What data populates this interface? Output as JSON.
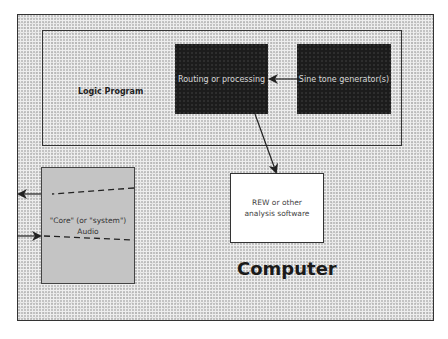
{
  "diagram": {
    "outer_box": {
      "label": "Computer"
    },
    "logic_program": {
      "label": "Logic Program"
    },
    "nodes": [
      {
        "id": "routing",
        "label": "Routing or processing"
      },
      {
        "id": "sine",
        "label": "Sine tone generator(s)"
      },
      {
        "id": "rew",
        "label": "REW or other analysis software"
      },
      {
        "id": "core_audio",
        "label": "\"Core\" (or \"system\") Audio"
      }
    ],
    "edges": [
      {
        "from": "sine",
        "to": "routing",
        "style": "solid"
      },
      {
        "from": "routing",
        "to": "rew",
        "style": "solid"
      },
      {
        "from": "core_audio",
        "to": "outside",
        "style": "dashed",
        "direction": "out"
      },
      {
        "from": "outside",
        "to": "core_audio",
        "style": "dashed",
        "direction": "in"
      }
    ]
  },
  "colors": {
    "dark_box": "#1c1c1c",
    "core_box": "#c4c4c4",
    "background": "#eeeeee"
  }
}
